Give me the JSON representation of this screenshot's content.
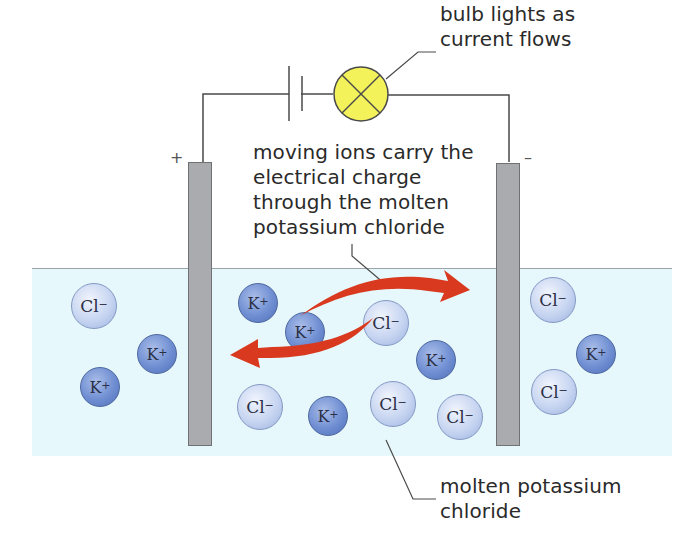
{
  "diagram": {
    "labels": {
      "bulb": "bulb lights as\ncurrent flows",
      "ions": "moving ions carry the\nelectrical charge\nthrough the molten\npotassium chloride",
      "liquid": "molten potassium\nchloride"
    },
    "electrodes": {
      "anode_sign": "+",
      "cathode_sign": "–"
    },
    "colors": {
      "liquid": "#e6f8fb",
      "electrode": "#a9abae",
      "bulb": "#f4f25a",
      "arrow": "#d9391f",
      "k_ion": "#6f8ed2",
      "cl_ion": "#c7d5f1"
    },
    "ions": [
      {
        "symbol": "Cl",
        "charge": "−",
        "type": "cl",
        "x": 71,
        "y": 283
      },
      {
        "symbol": "K",
        "charge": "+",
        "type": "k",
        "x": 137,
        "y": 334
      },
      {
        "symbol": "K",
        "charge": "+",
        "type": "k",
        "x": 80,
        "y": 367
      },
      {
        "symbol": "K",
        "charge": "+",
        "type": "k",
        "x": 238,
        "y": 283
      },
      {
        "symbol": "K",
        "charge": "+",
        "type": "k",
        "x": 285,
        "y": 312
      },
      {
        "symbol": "Cl",
        "charge": "−",
        "type": "cl",
        "x": 363,
        "y": 300
      },
      {
        "symbol": "K",
        "charge": "+",
        "type": "k",
        "x": 416,
        "y": 340
      },
      {
        "symbol": "Cl",
        "charge": "−",
        "type": "cl",
        "x": 237,
        "y": 384
      },
      {
        "symbol": "K",
        "charge": "+",
        "type": "k",
        "x": 308,
        "y": 396
      },
      {
        "symbol": "Cl",
        "charge": "−",
        "type": "cl",
        "x": 370,
        "y": 381
      },
      {
        "symbol": "Cl",
        "charge": "−",
        "type": "cl",
        "x": 437,
        "y": 394
      },
      {
        "symbol": "Cl",
        "charge": "−",
        "type": "cl",
        "x": 530,
        "y": 277
      },
      {
        "symbol": "K",
        "charge": "+",
        "type": "k",
        "x": 576,
        "y": 334
      },
      {
        "symbol": "Cl",
        "charge": "−",
        "type": "cl",
        "x": 531,
        "y": 369
      }
    ]
  }
}
